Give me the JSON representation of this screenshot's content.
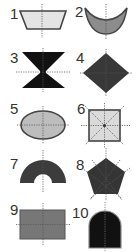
{
  "figure": {
    "shapes": [
      {
        "label": "1",
        "name": "trapezoid",
        "fill": "#e4e4e4",
        "stroke": "#444444"
      },
      {
        "label": "2",
        "name": "crescent",
        "fill": "#8c8c8c",
        "stroke": "#333333"
      },
      {
        "label": "3",
        "name": "hourglass",
        "fill": "#111111",
        "stroke": "#111111"
      },
      {
        "label": "4",
        "name": "rhombus",
        "fill": "#383838",
        "stroke": "#383838"
      },
      {
        "label": "5",
        "name": "ellipse",
        "fill": "#bdbdbd",
        "stroke": "#333333"
      },
      {
        "label": "6",
        "name": "square",
        "fill": "#dadada",
        "stroke": "#444444"
      },
      {
        "label": "7",
        "name": "half-annulus",
        "fill": "#3c3c3c",
        "stroke": "#3c3c3c"
      },
      {
        "label": "8",
        "name": "regular-pentagon",
        "fill": "#353535",
        "stroke": "#353535"
      },
      {
        "label": "9",
        "name": "rectangle",
        "fill": "#777777",
        "stroke": "#555555"
      },
      {
        "label": "10",
        "name": "arch",
        "fill": "#111111",
        "stroke": "#777777"
      }
    ]
  }
}
